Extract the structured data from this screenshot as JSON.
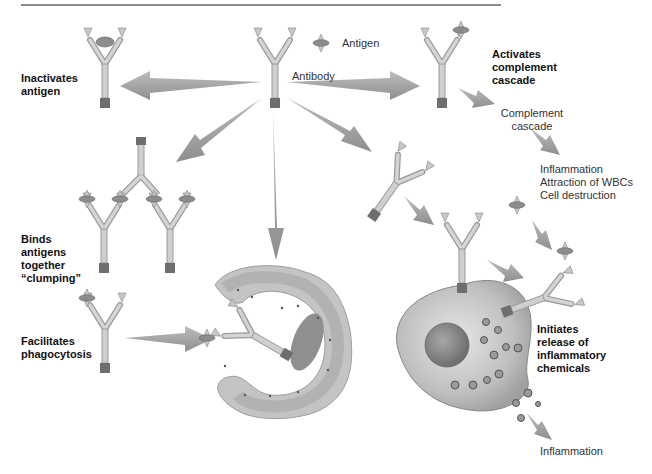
{
  "diagram": {
    "legend": {
      "antigen_label": "Antigen",
      "antibody_label": "Antibody"
    },
    "functions": [
      {
        "id": "inactivate",
        "label": "Inactivates\nantigen"
      },
      {
        "id": "complement",
        "label": "Activates\ncomplement\ncascade"
      },
      {
        "id": "clumping",
        "label": "Binds\nantigens\ntogether\n“clumping”"
      },
      {
        "id": "phagocytosis",
        "label": "Facilitates\nphagocytosis"
      },
      {
        "id": "inflammatory",
        "label": "Initiates\nrelease of\ninflammatory\nchemicals"
      }
    ],
    "outcomes": {
      "complement_cascade": "Complement\ncascade",
      "complement_effects": "Inflammation\nAttraction of WBCs\nCell destruction",
      "inflammation": "Inflammation"
    },
    "colors": {
      "arrow": "#a3a3a3",
      "antibody": "#c8c8c8",
      "antibody_stem_base": "#6e6e6e",
      "antigen": "#8c8c8c",
      "cell_fill": "#bdbdbd",
      "nucleus": "#8f8f8f",
      "text": "#1a1a1a"
    }
  }
}
